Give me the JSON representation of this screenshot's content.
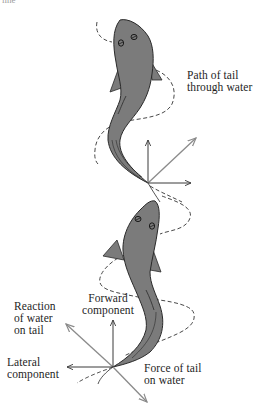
{
  "figure": {
    "top_fragment": "line",
    "colors": {
      "fish_fill": "#7b7b7b",
      "fish_outline": "#2a2a2a",
      "arrow_dark": "#3a3a3a",
      "arrow_gray": "#8a8a8a",
      "dashed_path": "#333333",
      "text": "#1e1e1e",
      "background": "#ffffff"
    },
    "top_diagram": {
      "label_path": [
        "Path of tail",
        "through water"
      ],
      "vectors": [
        "forward (up)",
        "resultant (diagonal up-right)",
        "lateral (right)"
      ]
    },
    "bottom_diagram": {
      "label_reaction": [
        "Reaction",
        "of water",
        "on tail"
      ],
      "label_forward": [
        "Forward",
        "component"
      ],
      "label_lateral": [
        "Lateral",
        "component"
      ],
      "label_force": [
        "Force of tail",
        "on water"
      ]
    }
  }
}
